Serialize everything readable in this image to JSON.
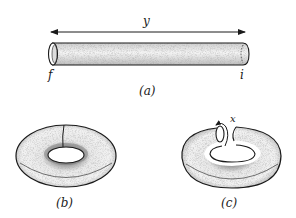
{
  "figure": {
    "panel_a": {
      "caption": "(a)",
      "dimension_label": "y",
      "left_end_label": "f",
      "right_end_label": "i",
      "description": "cylindrical tube with double-headed arrow of length y"
    },
    "panel_b": {
      "caption": "(b)",
      "description": "torus with a seam line"
    },
    "panel_c": {
      "caption": "(c)",
      "twist_label": "x",
      "description": "torus cut open with a twist arrow x around the cut"
    }
  },
  "colors": {
    "ink": "#1a1a1a",
    "shade": "#8a8a8a",
    "background": "#ffffff"
  }
}
